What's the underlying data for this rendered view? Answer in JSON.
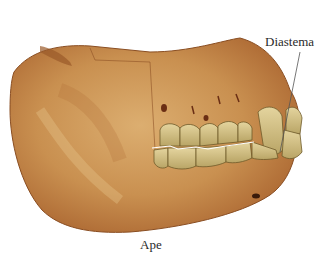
{
  "figure": {
    "labels": {
      "diastema": "Diastema",
      "caption": "Ape"
    },
    "colors": {
      "bone": "#c48a4c",
      "bone_light": "#dcae70",
      "bone_shadow": "#a8622e",
      "teeth": "#d9c68e",
      "teeth_shadow": "#a79658",
      "leader_line": "#555555",
      "background": "#ffffff"
    }
  }
}
